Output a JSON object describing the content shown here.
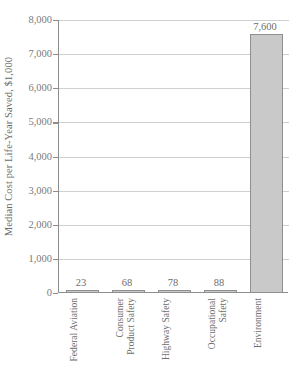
{
  "chart_data": {
    "type": "bar",
    "title": "",
    "xlabel": "",
    "ylabel": "Median Cost per Life-Year Saved, $1,000",
    "categories": [
      "Federal Aviation",
      "Consumer Product Safety",
      "Highway Safety",
      "Occupational Safety",
      "Environment"
    ],
    "category_lines": [
      [
        "Federal Aviation"
      ],
      [
        "Consumer",
        "Product Safety"
      ],
      [
        "Highway Safety"
      ],
      [
        "Occupational",
        "Safety"
      ],
      [
        "Environment"
      ]
    ],
    "values": [
      23,
      68,
      78,
      88,
      7600
    ],
    "value_labels": [
      "23",
      "68",
      "78",
      "88",
      "7,600"
    ],
    "ylim": [
      0,
      8000
    ],
    "yticks": [
      0,
      1000,
      2000,
      3000,
      4000,
      5000,
      6000,
      7000,
      8000
    ],
    "ytick_labels": [
      "0",
      "1,000",
      "2,000",
      "3,000",
      "4,000",
      "5,000",
      "6,000",
      "7,000",
      "8,000"
    ],
    "grid": true,
    "legend": null,
    "bar_color": "#c9c9c9",
    "bar_edge_color": "#8f8f8f",
    "grid_color": "#cfcfcf",
    "axis_color": "#8d8d8d",
    "text_color": "#6e6e6e"
  }
}
